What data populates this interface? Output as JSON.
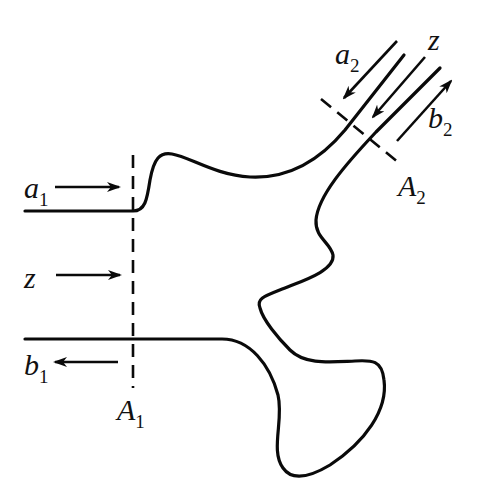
{
  "diagram": {
    "port1": {
      "incident_wave": {
        "symbol": "a",
        "subscript": "1"
      },
      "reflected_wave": {
        "symbol": "b",
        "subscript": "1"
      },
      "propagation_axis": {
        "symbol": "z"
      },
      "reference_plane": {
        "symbol": "A",
        "subscript": "1"
      }
    },
    "port2": {
      "incident_wave": {
        "symbol": "a",
        "subscript": "2"
      },
      "reflected_wave": {
        "symbol": "b",
        "subscript": "2"
      },
      "propagation_axis": {
        "symbol": "z"
      },
      "reference_plane": {
        "symbol": "A",
        "subscript": "2"
      }
    },
    "colors": {
      "line": "#0a0a0a",
      "background": "#ffffff"
    }
  }
}
